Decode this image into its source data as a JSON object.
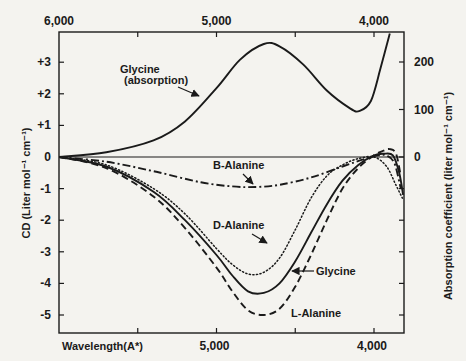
{
  "chart_data": {
    "type": "line",
    "title": "",
    "xlabel": "Wavelength(A*)",
    "ylabel": "CD (Liter mol⁻¹ cm⁻¹)",
    "ylabel_right": "Absorption coefficient (liter mol⁻¹ cm⁻¹)",
    "x_unit": "Angstrom",
    "xlim": [
      6000,
      3810
    ],
    "ylim": [
      -5.5,
      3.95
    ],
    "ylim_right": [
      0,
      260
    ],
    "grid": false,
    "legend": "none (inline annotations)",
    "x_ticks_top": [
      "6,000",
      "5,000",
      "4,000"
    ],
    "x_ticks_bottom": [
      "5,000",
      "4,000"
    ],
    "x_tick_values": [
      5500,
      5000,
      4500,
      4000
    ],
    "y_ticks_left": [
      {
        "value": 3,
        "label": "+3"
      },
      {
        "value": 2,
        "label": "+2"
      },
      {
        "value": 1,
        "label": "+1"
      },
      {
        "value": 0,
        "label": "0"
      },
      {
        "value": -1,
        "label": "-1"
      },
      {
        "value": -2,
        "label": "-2"
      },
      {
        "value": -3,
        "label": "-3"
      },
      {
        "value": -4,
        "label": "-4"
      },
      {
        "value": -5,
        "label": "-5"
      }
    ],
    "y_ticks_right": [
      {
        "value": 200,
        "label": "200"
      },
      {
        "value": 100,
        "label": "100"
      },
      {
        "value": 0,
        "label": "0"
      }
    ],
    "series": [
      {
        "name": "Glycine (absorption)",
        "axis": "right",
        "style": "solid",
        "x": [
          6000,
          5700,
          5400,
          5200,
          5000,
          4850,
          4700,
          4600,
          4450,
          4300,
          4150,
          4090,
          4020,
          3960,
          3900
        ],
        "y": [
          0,
          10,
          35,
          75,
          145,
          205,
          238,
          233,
          195,
          140,
          102,
          97,
          118,
          185,
          260
        ]
      },
      {
        "name": "B-Alanine",
        "axis": "left",
        "style": "dash-dot",
        "x": [
          6000,
          5700,
          5400,
          5100,
          4900,
          4750,
          4600,
          4400,
          4200,
          4050,
          3970,
          3920,
          3870,
          3830
        ],
        "y": [
          0,
          -0.15,
          -0.45,
          -0.8,
          -0.93,
          -0.95,
          -0.88,
          -0.65,
          -0.3,
          -0.05,
          0.05,
          0.05,
          -0.2,
          -1.0
        ]
      },
      {
        "name": "D-Alanine",
        "axis": "left",
        "style": "dotted",
        "x": [
          6000,
          5700,
          5400,
          5200,
          5000,
          4900,
          4800,
          4700,
          4600,
          4500,
          4400,
          4300,
          4200,
          4100,
          4000,
          3920,
          3860,
          3820
        ],
        "y": [
          0,
          -0.25,
          -1.0,
          -1.8,
          -2.9,
          -3.4,
          -3.7,
          -3.65,
          -3.2,
          -2.3,
          -1.3,
          -0.6,
          -0.25,
          -0.05,
          0.0,
          -0.3,
          -0.9,
          -1.3
        ]
      },
      {
        "name": "Glycine",
        "axis": "left",
        "style": "solid",
        "x": [
          6000,
          5700,
          5400,
          5200,
          5000,
          4900,
          4800,
          4700,
          4600,
          4500,
          4400,
          4300,
          4200,
          4100,
          4000,
          3940,
          3880,
          3840,
          3815
        ],
        "y": [
          0,
          -0.3,
          -1.1,
          -2.0,
          -3.1,
          -3.75,
          -4.25,
          -4.3,
          -4.0,
          -3.3,
          -2.4,
          -1.5,
          -0.75,
          -0.25,
          0.05,
          0.1,
          0.05,
          -0.5,
          -1.2
        ]
      },
      {
        "name": "L-Alanine",
        "axis": "left",
        "style": "dashed",
        "x": [
          6000,
          5700,
          5400,
          5200,
          5000,
          4900,
          4800,
          4700,
          4600,
          4500,
          4400,
          4300,
          4200,
          4100,
          4000,
          3940,
          3900,
          3860,
          3830
        ],
        "y": [
          0,
          -0.35,
          -1.25,
          -2.25,
          -3.5,
          -4.25,
          -4.85,
          -5.0,
          -4.8,
          -4.1,
          -3.1,
          -2.0,
          -1.0,
          -0.35,
          0.05,
          0.2,
          0.25,
          0.1,
          -0.6
        ]
      }
    ],
    "annotations": [
      {
        "text_lines": [
          "Glycine",
          "(absorption)"
        ],
        "points_to": "Glycine (absorption)"
      },
      {
        "text_lines": [
          "B-Alanine"
        ],
        "points_to": "B-Alanine"
      },
      {
        "text_lines": [
          "D-Alanine"
        ],
        "points_to": "D-Alanine"
      },
      {
        "text_lines": [
          "Glycine"
        ],
        "points_to": "Glycine"
      },
      {
        "text_lines": [
          "L-Alanine"
        ],
        "points_to": "L-Alanine"
      }
    ]
  }
}
